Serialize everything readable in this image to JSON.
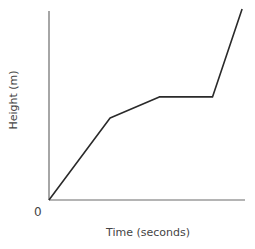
{
  "chart_data": {
    "type": "line",
    "title": "",
    "xlabel": "Time (seconds)",
    "ylabel": "Height (m)",
    "origin_label": "0",
    "grid": false,
    "legend": null,
    "xlim": [
      0,
      100
    ],
    "ylim": [
      0,
      100
    ],
    "series": [
      {
        "name": "height",
        "x": [
          0,
          31,
          56,
          83,
          98
        ],
        "y": [
          0,
          43,
          54,
          54,
          100
        ]
      }
    ],
    "annotations": "Unlabeled axes; qualitative piecewise-linear graph: steep rise, gentler rise, flat plateau, then steepest rise."
  },
  "colors": {
    "axis": "#6b6b6b",
    "line": "#2a2a2a",
    "text": "#444444"
  }
}
